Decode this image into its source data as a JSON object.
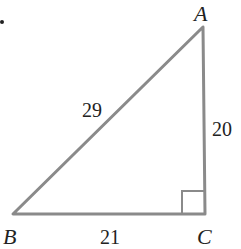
{
  "diagram": {
    "type": "right-triangle",
    "vertices": {
      "A": {
        "label": "A",
        "x": 203,
        "y": 27
      },
      "B": {
        "label": "B",
        "x": 13,
        "y": 214
      },
      "C": {
        "label": "C",
        "x": 205,
        "y": 214
      }
    },
    "sides": {
      "AB": {
        "label": "29"
      },
      "AC": {
        "label": "20"
      },
      "BC": {
        "label": "21"
      }
    },
    "right_angle_at": "C",
    "line_color": "#8a8a8a",
    "text_color": "#222222"
  }
}
